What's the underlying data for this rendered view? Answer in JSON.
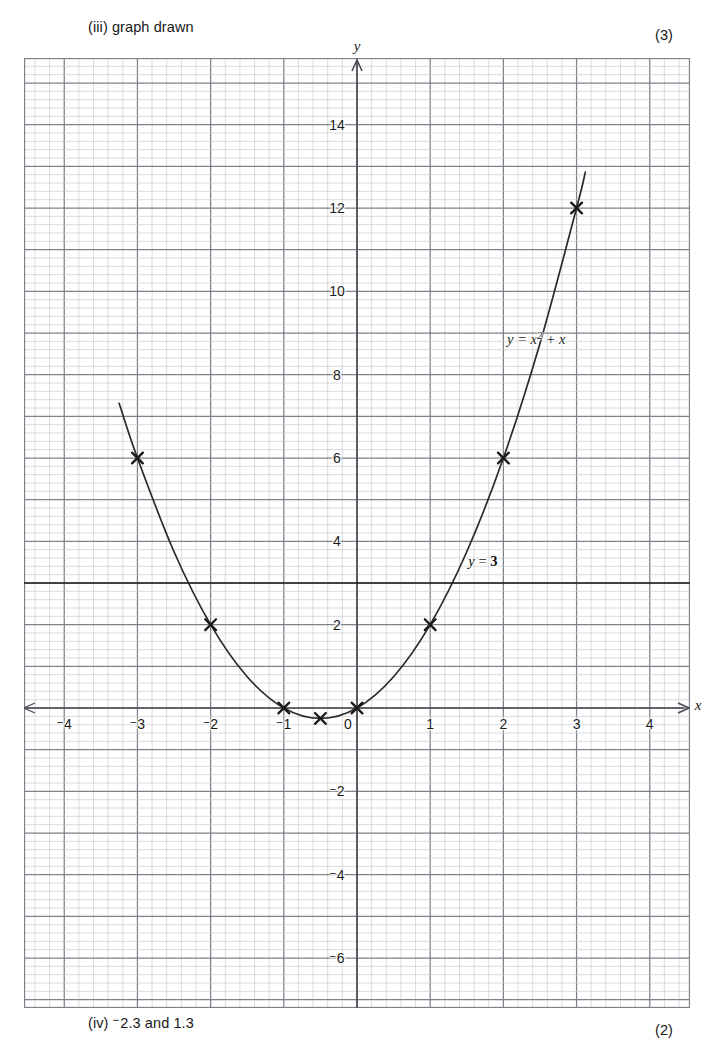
{
  "page": {
    "header_note": "(iii)  graph drawn",
    "header_marks": "(3)",
    "footer_note_prefix": "(iv)  ",
    "footer_note_minus": "−",
    "footer_note_value": "2.3 and 1.3",
    "footer_marks": "(2)"
  },
  "chart_data": {
    "type": "line",
    "title": "",
    "xlabel": "x",
    "ylabel": "y",
    "xlim": [
      -4.55,
      4.55
    ],
    "ylim": [
      -7.2,
      15.6
    ],
    "grid": true,
    "grid_minor_step": 0.2,
    "grid_major_step": 1,
    "legend": "none",
    "series": [
      {
        "name": "y = x^2 + x",
        "label_html": "y = x<sup>2</sup> + x",
        "label_at": {
          "x": 2.45,
          "y": 8.85
        },
        "x": [
          -3.25,
          -3,
          -2.5,
          -2,
          -1.5,
          -1,
          -0.5,
          0,
          0.5,
          1,
          1.5,
          2,
          2.5,
          3,
          3.12
        ],
        "y": [
          7.3125,
          6,
          3.75,
          2,
          0.75,
          0,
          -0.25,
          0,
          0.75,
          2,
          3.75,
          6,
          8.75,
          12,
          12.86
        ],
        "markers": [
          {
            "x": -3,
            "y": 6
          },
          {
            "x": -2,
            "y": 2
          },
          {
            "x": -1,
            "y": 0
          },
          {
            "x": -0.5,
            "y": -0.25
          },
          {
            "x": 0,
            "y": 0
          },
          {
            "x": 1,
            "y": 2
          },
          {
            "x": 2,
            "y": 6
          },
          {
            "x": 3,
            "y": 12
          }
        ]
      },
      {
        "name": "y = 3",
        "label_html": "<i>y</i> = <b>3</b>",
        "label_at": {
          "x": 1.72,
          "y": 3.52
        },
        "type": "horizontal-line",
        "y_value": 3
      }
    ],
    "x_ticks": [
      {
        "value": -4,
        "label": "4",
        "minus": true
      },
      {
        "value": -3,
        "label": "3",
        "minus": true
      },
      {
        "value": -2,
        "label": "2",
        "minus": true
      },
      {
        "value": -1,
        "label": "1",
        "minus": true
      },
      {
        "value": 0,
        "label": "0",
        "minus": false
      },
      {
        "value": 1,
        "label": "1",
        "minus": false
      },
      {
        "value": 2,
        "label": "2",
        "minus": false
      },
      {
        "value": 3,
        "label": "3",
        "minus": false
      },
      {
        "value": 4,
        "label": "4",
        "minus": false
      }
    ],
    "y_ticks": [
      {
        "value": 14,
        "label": "14",
        "minus": false
      },
      {
        "value": 12,
        "label": "12",
        "minus": false
      },
      {
        "value": 10,
        "label": "10",
        "minus": false
      },
      {
        "value": 8,
        "label": "8",
        "minus": false
      },
      {
        "value": 6,
        "label": "6",
        "minus": false
      },
      {
        "value": 4,
        "label": "4",
        "minus": false
      },
      {
        "value": 2,
        "label": "2",
        "minus": false
      },
      {
        "value": -2,
        "label": "2",
        "minus": true
      },
      {
        "value": -4,
        "label": "4",
        "minus": true
      },
      {
        "value": -6,
        "label": "6",
        "minus": true
      }
    ],
    "colors": {
      "grid_minor": "#c9ccd2",
      "grid_major": "#7d828a",
      "axis": "#4a4d52",
      "curve": "#2a2a2a",
      "marker": "#1a1a1a",
      "text": "#1a1a1a"
    }
  }
}
